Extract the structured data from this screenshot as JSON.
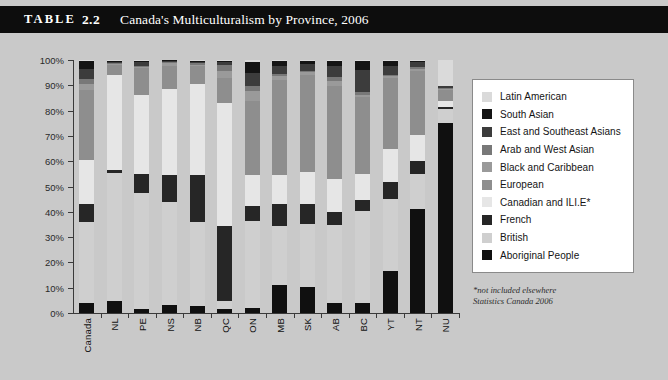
{
  "header": {
    "table_word": "TABLE",
    "table_number": "2.2",
    "title": "Canada's Multiculturalism by Province, 2006"
  },
  "footnote": {
    "line1": "*not included elsewhere",
    "line2": "Statistics Canada 2006"
  },
  "colors": {
    "background": "#c9c9c9",
    "titlebar": "#0d0d0d",
    "titlebar_text": "#ffffff",
    "axis": "#3a3a3a",
    "legend_bg": "#ffffff",
    "legend_border": "#8a8a8a"
  },
  "chart_data": {
    "type": "bar",
    "subtype": "stacked-100-percent",
    "title": "Canada's Multiculturalism by Province, 2006",
    "xlabel": "",
    "ylabel": "",
    "ylim": [
      0,
      100
    ],
    "ytick_labels": [
      "0%",
      "10%",
      "20%",
      "30%",
      "40%",
      "50%",
      "60%",
      "70%",
      "80%",
      "90%",
      "100%"
    ],
    "ytick_values": [
      0,
      10,
      20,
      30,
      40,
      50,
      60,
      70,
      80,
      90,
      100
    ],
    "grid": false,
    "legend_position": "right",
    "categories": [
      "Canada",
      "NL",
      "PE",
      "NS",
      "NB",
      "QC",
      "ON",
      "MB",
      "SK",
      "AB",
      "BC",
      "YT",
      "NT",
      "NU"
    ],
    "series": [
      {
        "name": "Aboriginal People",
        "color": "#101010",
        "values": [
          3.8,
          4.6,
          1.6,
          3.2,
          2.8,
          1.6,
          1.8,
          11.0,
          10.4,
          4.0,
          3.8,
          16.6,
          37.0,
          75.0
        ]
      },
      {
        "name": "British",
        "color": "#cfcfcf",
        "values": [
          32.2,
          50.6,
          46.0,
          40.8,
          33.0,
          3.0,
          34.6,
          23.4,
          24.6,
          30.6,
          36.6,
          28.4,
          12.6,
          5.6
        ]
      },
      {
        "name": "French",
        "color": "#262626",
        "values": [
          7.0,
          1.4,
          7.4,
          10.4,
          18.6,
          29.8,
          5.8,
          8.6,
          8.0,
          5.4,
          4.2,
          6.6,
          4.6,
          0.8
        ]
      },
      {
        "name": "Canadian and ILI.E*",
        "color": "#e6e6e6",
        "values": [
          17.6,
          37.4,
          31.0,
          34.2,
          36.0,
          48.6,
          12.2,
          11.4,
          12.8,
          13.0,
          10.4,
          13.4,
          9.2,
          2.6
        ]
      },
      {
        "name": "European",
        "color": "#8e8e8e",
        "values": [
          27.4,
          4.2,
          11.0,
          9.0,
          7.4,
          10.0,
          29.4,
          37.6,
          38.4,
          36.8,
          30.2,
          28.0,
          22.6,
          4.2
        ]
      },
      {
        "name": "Black and Caribbean",
        "color": "#9a9a9a",
        "values": [
          2.6,
          0.4,
          0.4,
          1.2,
          0.4,
          2.6,
          3.8,
          1.8,
          1.0,
          1.8,
          1.0,
          0.6,
          1.0,
          0.4
        ]
      },
      {
        "name": "Arab and West Asian",
        "color": "#787878",
        "values": [
          1.8,
          0.2,
          0.4,
          0.6,
          0.6,
          2.4,
          2.2,
          0.8,
          0.6,
          1.6,
          1.2,
          0.4,
          0.6,
          0.4
        ]
      },
      {
        "name": "East and Southeast Asians",
        "color": "#3c3c3c",
        "values": [
          4.2,
          0.6,
          1.4,
          0.4,
          0.6,
          1.4,
          5.0,
          3.2,
          2.8,
          4.6,
          8.8,
          3.6,
          1.8,
          0.6
        ]
      },
      {
        "name": "South Asian",
        "color": "#141414",
        "values": [
          3.2,
          0.4,
          0.6,
          0.2,
          0.4,
          0.4,
          4.6,
          1.8,
          1.2,
          2.0,
          3.4,
          2.2,
          0.4,
          0.2
        ]
      },
      {
        "name": "Latin American",
        "color": "#dadada",
        "values": [
          0.2,
          0.2,
          0.2,
          0.0,
          0.2,
          0.2,
          0.6,
          0.4,
          0.2,
          0.2,
          0.4,
          0.2,
          0.2,
          10.2
        ]
      }
    ],
    "legend_order": [
      {
        "label": "Latin American",
        "color": "#dadada"
      },
      {
        "label": "South Asian",
        "color": "#141414"
      },
      {
        "label": "East and Southeast Asians",
        "color": "#3c3c3c"
      },
      {
        "label": "Arab and West Asian",
        "color": "#787878"
      },
      {
        "label": "Black and Caribbean",
        "color": "#9a9a9a"
      },
      {
        "label": "European",
        "color": "#8e8e8e"
      },
      {
        "label": "Canadian and ILI.E*",
        "color": "#e6e6e6"
      },
      {
        "label": "French",
        "color": "#262626"
      },
      {
        "label": "British",
        "color": "#cfcfcf"
      },
      {
        "label": "Aboriginal People",
        "color": "#101010"
      }
    ]
  }
}
